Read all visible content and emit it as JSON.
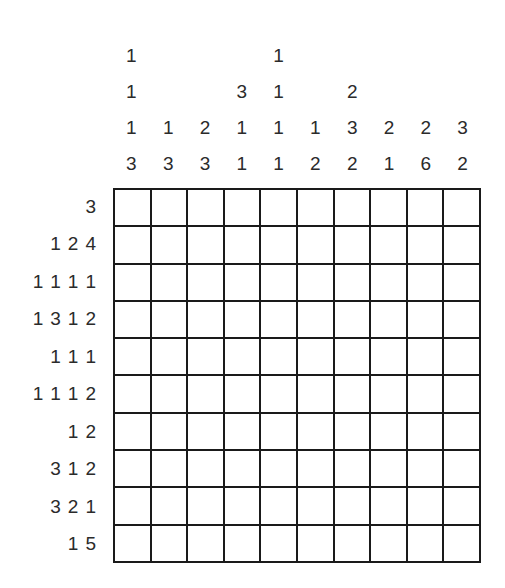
{
  "puzzle": {
    "type": "nonogram",
    "rows": 10,
    "columns": 10,
    "grid_filled": false,
    "colors": {
      "background": "#ffffff",
      "grid_line": "#1a1a1a",
      "clue_text": "#2b2b2b",
      "cell_fill": "#ffffff"
    },
    "column_clues": [
      [
        1,
        1,
        1,
        3
      ],
      [
        1,
        3
      ],
      [
        2,
        3
      ],
      [
        3,
        1,
        1
      ],
      [
        1,
        1,
        1,
        1
      ],
      [
        1,
        2
      ],
      [
        2,
        3,
        2
      ],
      [
        2,
        1
      ],
      [
        2,
        6
      ],
      [
        3,
        2
      ]
    ],
    "column_clue_rows": [
      [
        "1",
        "",
        "",
        "",
        "1",
        "",
        "",
        "",
        "",
        ""
      ],
      [
        "1",
        "",
        "",
        "3",
        "1",
        "",
        "2",
        "",
        "",
        ""
      ],
      [
        "1",
        "1",
        "2",
        "1",
        "1",
        "1",
        "3",
        "2",
        "2",
        "3"
      ],
      [
        "3",
        "3",
        "3",
        "1",
        "1",
        "2",
        "2",
        "1",
        "6",
        "2"
      ]
    ],
    "row_clues": [
      [
        3
      ],
      [
        1,
        2,
        4
      ],
      [
        1,
        1,
        1,
        1
      ],
      [
        1,
        3,
        1,
        2
      ],
      [
        1,
        1,
        1
      ],
      [
        1,
        1,
        1,
        2
      ],
      [
        1,
        2
      ],
      [
        3,
        1,
        2
      ],
      [
        3,
        2,
        1
      ],
      [
        1,
        5
      ]
    ]
  }
}
